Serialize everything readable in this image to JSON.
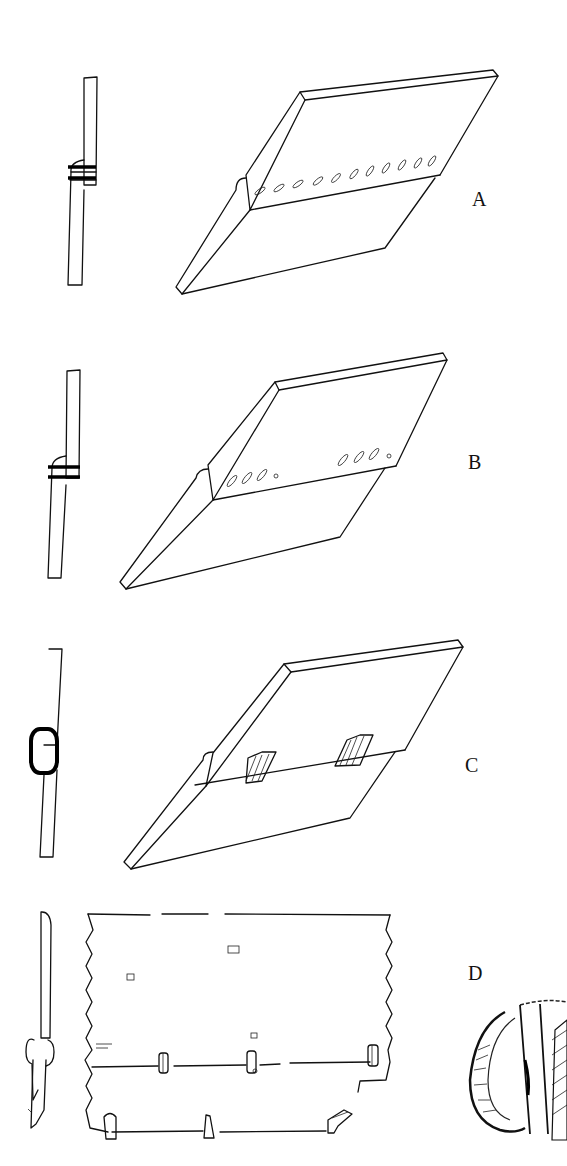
{
  "figure": {
    "panels": [
      {
        "label": "A",
        "description": "Overlapping boards joined by a continuous row of lashing holes; side section with two binding bands"
      },
      {
        "label": "B",
        "description": "Overlapping boards joined by two groups of lashing holes; side section with two binding bands"
      },
      {
        "label": "C",
        "description": "Overlapping boards joined by two wrapped lashing bundles; side section with an oval loop"
      },
      {
        "label": "D",
        "description": "Plan of planking with stitched seams and a detail of a coiled binding"
      }
    ]
  }
}
